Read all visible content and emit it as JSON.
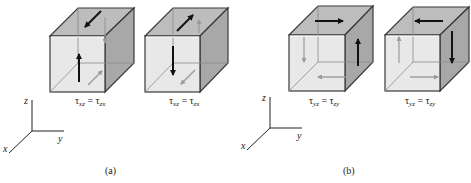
{
  "figure": {
    "panels": [
      {
        "id": "a",
        "caption": "(a)",
        "axes": {
          "z": "z",
          "y": "y",
          "x": "x"
        },
        "cubes": [
          {
            "label_sym1": "τ",
            "sub1": "xz",
            "eq": " = ",
            "label_sym2": "τ",
            "sub2": "zx",
            "description": "upward shear on front face, shear toward -x on top face"
          },
          {
            "label_sym1": "τ",
            "sub1": "xz",
            "eq": " = ",
            "label_sym2": "τ",
            "sub2": "zx",
            "description": "downward shear on front face, shear toward +x on top face"
          }
        ]
      },
      {
        "id": "b",
        "caption": "(b)",
        "axes": {
          "z": "z",
          "y": "y",
          "x": "x"
        },
        "cubes": [
          {
            "label_sym1": "τ",
            "sub1": "yz",
            "eq": " = ",
            "label_sym2": "τ",
            "sub2": "zy",
            "description": "upward shear on right face, shear toward +y on top face"
          },
          {
            "label_sym1": "τ",
            "sub1": "yz",
            "eq": " = ",
            "label_sym2": "τ",
            "sub2": "zy",
            "description": "downward shear on right face, shear toward -y on top face"
          }
        ]
      }
    ],
    "colors": {
      "front_face": "#e6e6e6",
      "top_face": "#bdbdbd",
      "right_face": "#a8a8a8",
      "edge": "#3a3a3a",
      "hidden_edge": "#8c8c8c",
      "arrow_dark": "#111111",
      "arrow_light": "#9a9a9a"
    }
  }
}
